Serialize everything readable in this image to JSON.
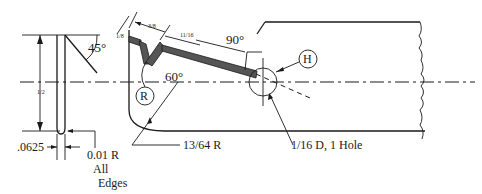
{
  "drawing": {
    "angles": {
      "left_chamfer": "45°",
      "top_right": "90°",
      "center": "60°"
    },
    "dimensions": {
      "top_small": "1/8",
      "top_mid": "3/8",
      "top_long": "11/16",
      "left_vertical": "1/2",
      "slot_width": ".0625",
      "edge_radius": "0.01 R",
      "edge_note_1": "All",
      "edge_note_2": "Edges",
      "bottom_radius": "13/64 R",
      "hole": "1/16 D, 1 Hole"
    },
    "callouts": {
      "radius_label": "R",
      "hole_label": "H"
    }
  }
}
